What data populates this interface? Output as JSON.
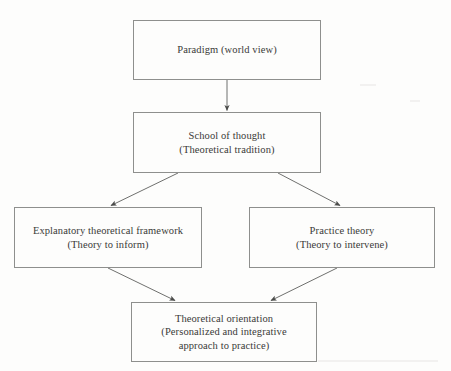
{
  "diagram": {
    "background_color": "#fdfdfc",
    "line_color": "#6f706e",
    "text_color": "#3a3a38",
    "nodes": [
      {
        "id": "paradigm",
        "lines": [
          "Paradigm (world view)"
        ]
      },
      {
        "id": "school",
        "lines": [
          "School of thought",
          "(Theoretical tradition)"
        ]
      },
      {
        "id": "explanatory",
        "lines": [
          "Explanatory theoretical framework",
          "(Theory to inform)"
        ]
      },
      {
        "id": "practice",
        "lines": [
          "Practice theory",
          "(Theory to intervene)"
        ]
      },
      {
        "id": "orientation",
        "lines": [
          "Theoretical orientation",
          "(Personalized and integrative",
          "approach to practice)"
        ]
      }
    ],
    "edges": [
      {
        "from": "paradigm",
        "to": "school",
        "style": "vertical-arrow"
      },
      {
        "from": "school",
        "to": "explanatory",
        "style": "diagonal-arrow"
      },
      {
        "from": "school",
        "to": "practice",
        "style": "diagonal-arrow"
      },
      {
        "from": "explanatory",
        "to": "orientation",
        "style": "diagonal-arrow"
      },
      {
        "from": "practice",
        "to": "orientation",
        "style": "diagonal-arrow"
      }
    ]
  }
}
